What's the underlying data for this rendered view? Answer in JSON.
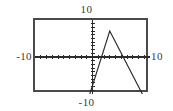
{
  "graph": {
    "window_labels": {
      "ymax": "10",
      "ymin": "-10",
      "xmin": "-10",
      "xmax": "10"
    },
    "frame_color": "#4a4a4a",
    "curve_color": "#2b2b2b",
    "axis_color": "#2b2b2b",
    "background": "#ffffff"
  },
  "chart_data": {
    "type": "line",
    "title": "",
    "xlabel": "",
    "ylabel": "",
    "xlim": [
      -10,
      10
    ],
    "ylim": [
      -10,
      10
    ],
    "grid": false,
    "legend": null,
    "axes": {
      "x_axis_at_y": 0,
      "y_axis_at_x": 0,
      "x_tick_interval": 1,
      "y_tick_interval": 1,
      "tick_marks": true
    },
    "series": [
      {
        "name": "y = 7 - 3|x - 3|",
        "description": "steep rising line from lower-left to a peak, then a gentler line falling to the lower-right",
        "x": [
          -1.2,
          3.0,
          10.0
        ],
        "y": [
          -13.6,
          7.0,
          -14.0
        ],
        "vertex": [
          3.0,
          7.0
        ],
        "x_intercepts": [
          0.7,
          5.3
        ],
        "left_slope": 5,
        "right_slope": -3
      }
    ]
  }
}
